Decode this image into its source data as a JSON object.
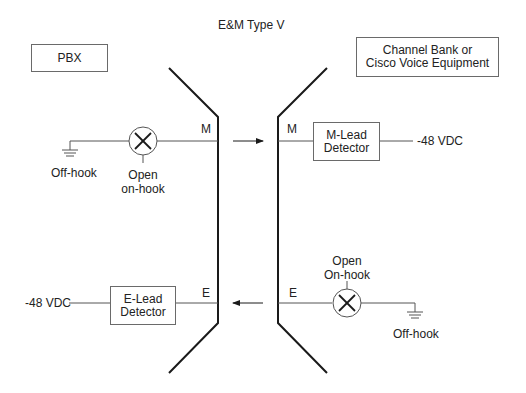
{
  "title": "E&M Type V",
  "left_side": {
    "device_label": "PBX",
    "m_lead": {
      "lead_label": "M",
      "ground_label": "Off-hook",
      "lamp_label_line1": "Open",
      "lamp_label_line2": "on-hook"
    },
    "e_lead": {
      "lead_label": "E",
      "detector_line1": "E-Lead",
      "detector_line2": "Detector",
      "voltage_label": "-48 VDC"
    }
  },
  "right_side": {
    "device_label_line1": "Channel Bank or",
    "device_label_line2": "Cisco Voice Equipment",
    "m_lead": {
      "lead_label": "M",
      "detector_line1": "M-Lead",
      "detector_line2": "Detector",
      "voltage_label": "-48 VDC"
    },
    "e_lead": {
      "lead_label": "E",
      "lamp_label_line1": "Open",
      "lamp_label_line2": "On-hook",
      "ground_label": "Off-hook"
    }
  },
  "signals": [
    {
      "lead": "M",
      "direction": "left-to-right"
    },
    {
      "lead": "E",
      "direction": "right-to-left"
    }
  ],
  "colors": {
    "line": "#1a1a1a",
    "thin_line": "#555555",
    "box_border": "#6a6a6a",
    "text": "#222222"
  }
}
